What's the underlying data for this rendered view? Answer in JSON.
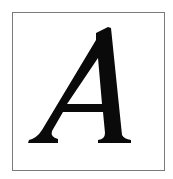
{
  "card": {
    "letter": "A",
    "glyph_color": "#0a0a0a",
    "border_color": "#7a7a7a",
    "background_color": "#ffffff"
  }
}
